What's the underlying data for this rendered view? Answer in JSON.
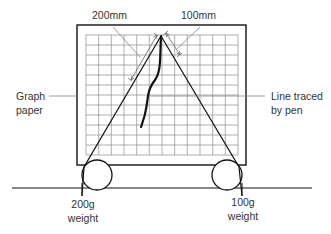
{
  "diagram": {
    "labels": {
      "left_dimension": "200mm",
      "right_dimension": "100mm",
      "graph_paper_line1": "Graph",
      "graph_paper_line2": "paper",
      "pen_line_line1": "Line traced",
      "pen_line_line2": "by pen",
      "left_weight_line1": "200g",
      "left_weight_line2": "weight",
      "right_weight_line1": "100g",
      "right_weight_line2": "weight"
    },
    "components": {
      "frame": {
        "x": 77,
        "y": 25,
        "width": 169,
        "height": 140
      },
      "graph_paper": {
        "x": 86,
        "y": 35,
        "width": 152,
        "height": 120,
        "columns": 12,
        "rows": 12
      },
      "apex": {
        "x": 161,
        "y": 36
      },
      "left_pulley": {
        "cx": 97,
        "cy": 175,
        "r": 15
      },
      "right_pulley": {
        "cx": 227,
        "cy": 175,
        "r": 15
      },
      "ground_line": {
        "y": 188,
        "x1": 12,
        "x2": 312
      }
    },
    "colors": {
      "line": "#111111",
      "grid": "#9a9a9a",
      "text": "#333333",
      "leader": "#888888"
    }
  }
}
